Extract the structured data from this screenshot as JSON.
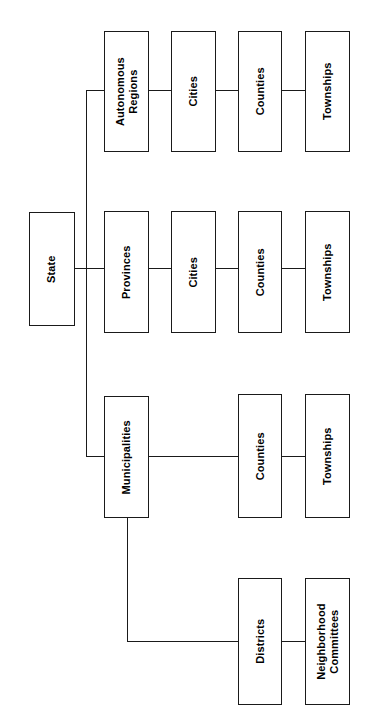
{
  "diagram": {
    "orientation": "rotated-90-counterclockwise",
    "background_color": "#ffffff",
    "line_color": "#1a1a1a",
    "text_color": "#000000",
    "nodes": [
      {
        "id": "state",
        "label": "State",
        "x": 29,
        "y": 212,
        "w": 46,
        "h": 114
      },
      {
        "id": "autonomous-regions",
        "label": "Autonomous\nRegions",
        "x": 104,
        "y": 31,
        "w": 45,
        "h": 121
      },
      {
        "id": "cities-ar",
        "label": "Cities",
        "x": 171,
        "y": 31,
        "w": 45,
        "h": 121
      },
      {
        "id": "counties-ar",
        "label": "Counties",
        "x": 238,
        "y": 31,
        "w": 44,
        "h": 121
      },
      {
        "id": "townships-ar",
        "label": "Townships",
        "x": 305,
        "y": 31,
        "w": 45,
        "h": 121
      },
      {
        "id": "provinces",
        "label": "Provinces",
        "x": 104,
        "y": 211,
        "w": 45,
        "h": 122
      },
      {
        "id": "cities-prov",
        "label": "Cities",
        "x": 171,
        "y": 211,
        "w": 45,
        "h": 122
      },
      {
        "id": "counties-prov",
        "label": "Counties",
        "x": 238,
        "y": 211,
        "w": 44,
        "h": 122
      },
      {
        "id": "townships-prov",
        "label": "Townships",
        "x": 305,
        "y": 211,
        "w": 45,
        "h": 122
      },
      {
        "id": "municipalities",
        "label": "Municipalities",
        "x": 104,
        "y": 396,
        "w": 45,
        "h": 122
      },
      {
        "id": "counties-muni",
        "label": "Counties",
        "x": 238,
        "y": 394,
        "w": 44,
        "h": 124
      },
      {
        "id": "townships-muni",
        "label": "Townships",
        "x": 305,
        "y": 394,
        "w": 45,
        "h": 124
      },
      {
        "id": "districts",
        "label": "Districts",
        "x": 238,
        "y": 578,
        "w": 44,
        "h": 127
      },
      {
        "id": "neighborhood-committees",
        "label": "Neighborhood\nCommittees",
        "x": 305,
        "y": 578,
        "w": 45,
        "h": 127
      }
    ],
    "edges": [
      {
        "id": "trunk-vertical",
        "type": "v",
        "x": 86,
        "y": 90,
        "len": 367
      },
      {
        "id": "state-to-trunk",
        "type": "h",
        "x": 75,
        "y": 268,
        "len": 30
      },
      {
        "id": "trunk-to-autonomous",
        "type": "h",
        "x": 86,
        "y": 90,
        "len": 19
      },
      {
        "id": "trunk-to-municipalities",
        "type": "h",
        "x": 86,
        "y": 456,
        "len": 19
      },
      {
        "id": "autonomous-to-cities",
        "type": "h",
        "x": 148,
        "y": 90,
        "len": 24
      },
      {
        "id": "cities-to-counties-ar",
        "type": "h",
        "x": 215,
        "y": 90,
        "len": 24
      },
      {
        "id": "counties-to-townships-ar",
        "type": "h",
        "x": 281,
        "y": 90,
        "len": 25
      },
      {
        "id": "provinces-to-cities",
        "type": "h",
        "x": 148,
        "y": 268,
        "len": 24
      },
      {
        "id": "cities-to-counties-prov",
        "type": "h",
        "x": 215,
        "y": 268,
        "len": 24
      },
      {
        "id": "counties-to-townships-prov",
        "type": "h",
        "x": 281,
        "y": 268,
        "len": 25
      },
      {
        "id": "municipalities-to-counties",
        "type": "h",
        "x": 148,
        "y": 456,
        "len": 91
      },
      {
        "id": "counties-to-townships-muni",
        "type": "h",
        "x": 281,
        "y": 456,
        "len": 25
      },
      {
        "id": "municipalities-drop",
        "type": "v",
        "x": 127,
        "y": 518,
        "len": 124
      },
      {
        "id": "drop-to-districts",
        "type": "h",
        "x": 127,
        "y": 641,
        "len": 112
      },
      {
        "id": "districts-to-neighborhood",
        "type": "h",
        "x": 281,
        "y": 641,
        "len": 25
      }
    ]
  }
}
